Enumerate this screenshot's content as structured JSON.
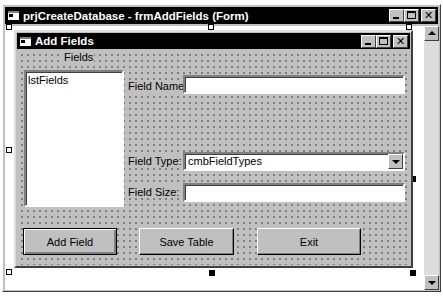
{
  "outer_window": {
    "title": "prjCreateDatabase - frmAddFields (Form)",
    "buttons": [
      "minimize",
      "maximize",
      "close"
    ]
  },
  "form": {
    "title": "Add Fields",
    "buttons": {
      "add_field": "Add Field",
      "save_table": "Save Table",
      "exit": "Exit"
    },
    "fields_label": "Fields",
    "listbox": {
      "name": "lstFields",
      "items": []
    },
    "field_name": {
      "label": "Field Name:",
      "value": ""
    },
    "field_type": {
      "label": "Field Type:",
      "value": "cmbFieldTypes"
    },
    "field_size": {
      "label": "Field Size:",
      "value": ""
    }
  },
  "colors": {
    "title_bar": "#000000",
    "face": "#c0c0c0",
    "design_area": "#ffffff"
  }
}
